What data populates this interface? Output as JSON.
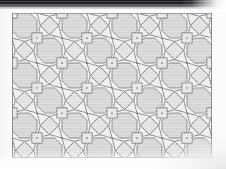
{
  "page": {
    "background_color": "#fcfcfc",
    "width": 226,
    "height": 169
  },
  "scan_artifacts": {
    "top_band": {
      "name": "dark scanner band",
      "color": "#17181c",
      "height_px": 9,
      "taper_side": "right"
    },
    "bottom_fade": {
      "name": "paper fade",
      "color": "#ffffff"
    },
    "corner_shade": {
      "name": "corner vignette",
      "color": "#e6e7e9"
    }
  },
  "figure": {
    "name": "octagon-square-triangle tessellation",
    "x": 12,
    "y": 13,
    "width": 200,
    "height": 145,
    "stroke_color": "#7d7d80",
    "stroke_width": 0.9,
    "vertex_color": "#6a6a6d",
    "tile_fills": {
      "octagon": "#d6d6d6",
      "square": "#e6e6e6",
      "triangle": "#efefef",
      "rotated_square": "#e1e1e1",
      "background": "#f2f2f2"
    },
    "grid": {
      "cell_size": 25,
      "columns": 8,
      "rows": 6
    }
  }
}
